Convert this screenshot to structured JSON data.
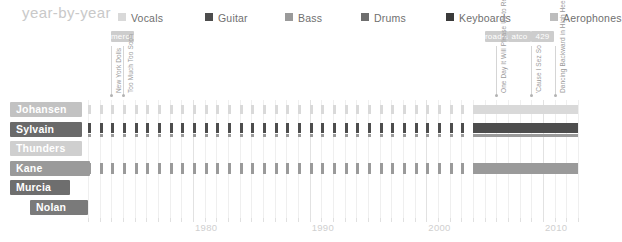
{
  "header": {
    "title": "year-by-year",
    "legend": [
      {
        "label": "Vocals",
        "color": "#d9d9d9",
        "x": 0
      },
      {
        "label": "Guitar",
        "color": "#4d4d4d",
        "x": 87
      },
      {
        "label": "Bass",
        "color": "#9a9a9a",
        "x": 167
      },
      {
        "label": "Drums",
        "color": "#6e6e6e",
        "x": 243
      },
      {
        "label": "Keyboards",
        "color": "#3a3a3a",
        "x": 328
      },
      {
        "label": "Aerophones",
        "color": "#bdbdbd",
        "x": 432
      }
    ]
  },
  "axis": {
    "start_year": 1971,
    "end_year": 2013,
    "ticks": [
      {
        "year": 1980,
        "label": "1980"
      },
      {
        "year": 1990,
        "label": "1990"
      },
      {
        "year": 2000,
        "label": "2000"
      },
      {
        "year": 2010,
        "label": "2010"
      }
    ]
  },
  "labels": [
    {
      "name": "mercury",
      "color": "#cdcdcd",
      "start_year": 1973,
      "end_year": 1975
    },
    {
      "name": "roadrunner",
      "color": "#cdcdcd",
      "start_year": 2005,
      "end_year": 2007
    },
    {
      "name": "atco",
      "color": "#cdcdcd",
      "start_year": 2007,
      "end_year": 2009
    },
    {
      "name": "429",
      "color": "#cdcdcd",
      "start_year": 2009,
      "end_year": 2011
    }
  ],
  "albums": [
    {
      "title": "New York Dolls",
      "year": 1973
    },
    {
      "title": "Too Much Too Soon",
      "year": 1974
    },
    {
      "title": "One Day It Will Please Us to Remember Even This",
      "year": 2006
    },
    {
      "title": "'Cause I Sez So",
      "year": 2009
    },
    {
      "title": "Dancing Backward in High Heels",
      "year": 2011
    }
  ],
  "rows": [
    {
      "name": "Johansen",
      "name_color": "#c2c2c2",
      "name_width": 72,
      "name_indent": 10,
      "instruments": [
        "Vocals"
      ],
      "bars": [
        {
          "instrument": "Vocals",
          "color": "#d9d9d9",
          "start_year": 1971,
          "end_year": 2013,
          "mode": "ticks",
          "top": 3,
          "height": 9
        },
        {
          "instrument": "Vocals",
          "color": "#d9d9d9",
          "start_year": 2004,
          "end_year": 2013,
          "mode": "solid",
          "top": 3,
          "height": 9
        }
      ]
    },
    {
      "name": "Sylvain",
      "name_color": "#6a6a6a",
      "name_width": 72,
      "name_indent": 10,
      "instruments": [
        "Guitar",
        "Bass"
      ],
      "bars": [
        {
          "instrument": "Guitar",
          "color": "#4d4d4d",
          "start_year": 1971,
          "end_year": 2013,
          "mode": "ticks",
          "top": 1,
          "height": 10
        },
        {
          "instrument": "Guitar",
          "color": "#4d4d4d",
          "start_year": 2004,
          "end_year": 2013,
          "mode": "solid",
          "top": 1,
          "height": 10
        },
        {
          "instrument": "Bass",
          "color": "#9a9a9a",
          "start_year": 1971,
          "end_year": 2013,
          "mode": "ticks",
          "top": 12,
          "height": 3
        },
        {
          "instrument": "Bass",
          "color": "#9a9a9a",
          "start_year": 2004,
          "end_year": 2013,
          "mode": "solid",
          "top": 12,
          "height": 3
        }
      ]
    },
    {
      "name": "Thunders",
      "name_color": "#cfcfcf",
      "name_width": 72,
      "name_indent": 10,
      "instruments": [
        "Guitar"
      ],
      "bars": []
    },
    {
      "name": "Kane",
      "name_color": "#9a9a9a",
      "name_width": 80,
      "name_indent": 10,
      "instruments": [
        "Bass"
      ],
      "bars": [
        {
          "instrument": "Bass",
          "color": "#9a9a9a",
          "start_year": 1971,
          "end_year": 2013,
          "mode": "ticks",
          "top": 2,
          "height": 11
        },
        {
          "instrument": "Bass",
          "color": "#9a9a9a",
          "start_year": 2004,
          "end_year": 2013,
          "mode": "solid",
          "top": 2,
          "height": 11
        }
      ]
    },
    {
      "name": "Murcia",
      "name_color": "#6e6e6e",
      "name_width": 60,
      "name_indent": 10,
      "instruments": [
        "Drums"
      ],
      "bars": []
    },
    {
      "name": "Nolan",
      "name_color": "#7a7a7a",
      "name_width": 58,
      "name_indent": 30,
      "instruments": [
        "Drums"
      ],
      "bars": []
    }
  ],
  "chart_data": {
    "type": "bar",
    "title": "year-by-year",
    "xlabel": "",
    "ylabel": "",
    "xlim": [
      1971,
      2013
    ],
    "grid": true,
    "legend_position": "top",
    "categories": [
      "Johansen",
      "Sylvain",
      "Thunders",
      "Kane",
      "Murcia",
      "Nolan"
    ],
    "series": [
      {
        "name": "Vocals",
        "color": "#d9d9d9",
        "values": [
          1,
          0,
          0,
          0,
          0,
          0
        ]
      },
      {
        "name": "Guitar",
        "color": "#4d4d4d",
        "values": [
          0,
          1,
          1,
          0,
          0,
          0
        ]
      },
      {
        "name": "Bass",
        "color": "#9a9a9a",
        "values": [
          0,
          1,
          0,
          1,
          0,
          0
        ]
      },
      {
        "name": "Drums",
        "color": "#6e6e6e",
        "values": [
          0,
          0,
          0,
          0,
          1,
          1
        ]
      },
      {
        "name": "Keyboards",
        "color": "#3a3a3a",
        "values": [
          0,
          0,
          0,
          0,
          0,
          0
        ]
      },
      {
        "name": "Aerophones",
        "color": "#bdbdbd",
        "values": [
          0,
          0,
          0,
          0,
          0,
          0
        ]
      }
    ],
    "tick_labels": [
      "1980",
      "1990",
      "2000",
      "2010"
    ]
  }
}
